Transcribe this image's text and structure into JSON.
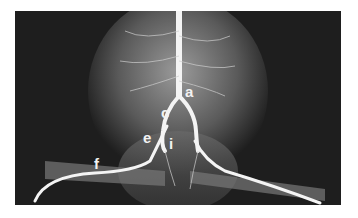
{
  "figure": {
    "labels": {
      "a": "a",
      "c": "c",
      "e": "e",
      "i": "i",
      "f": "f"
    }
  }
}
